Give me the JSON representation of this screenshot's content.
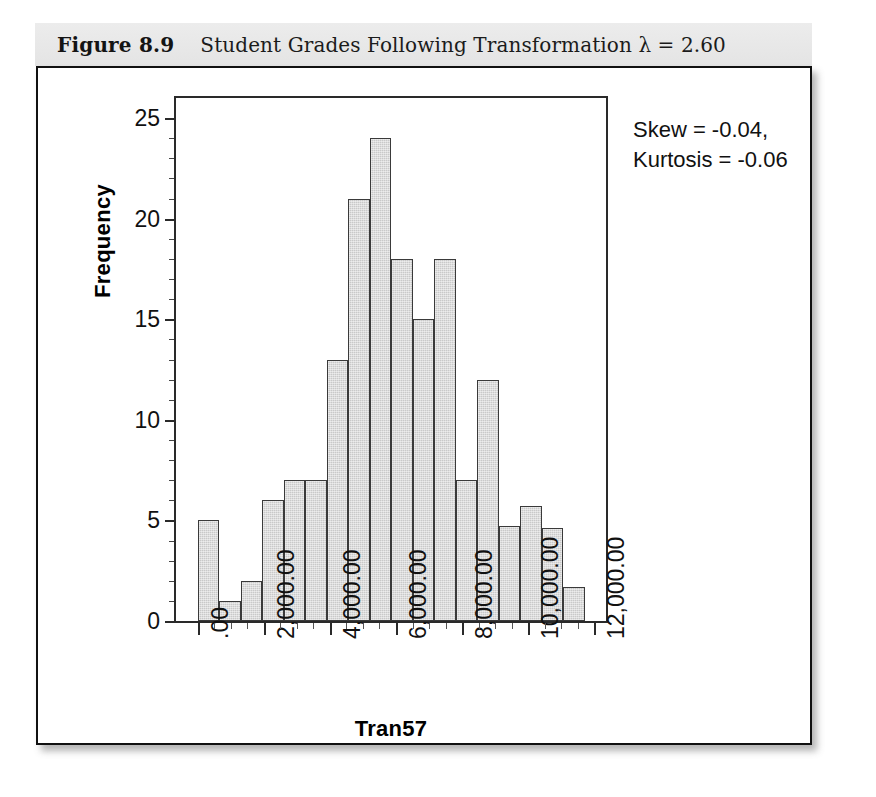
{
  "figure": {
    "number": "Figure 8.9",
    "caption": "Student Grades Following Transformation λ = 2.60"
  },
  "annotation": {
    "skew": "Skew = -0.04,",
    "kurtosis": "Kurtosis = -0.06"
  },
  "chart_data": {
    "type": "bar",
    "title": "Student Grades Following Transformation λ = 2.60",
    "xlabel": "Tran57",
    "ylabel": "Frequency",
    "xlim": [
      -650,
      12350
    ],
    "ylim": [
      0,
      26
    ],
    "grid": false,
    "legend": null,
    "bin_width": 650,
    "ytick_labels": [
      "0",
      "5",
      "10",
      "15",
      "20",
      "25"
    ],
    "ytick_values": [
      0,
      5,
      10,
      15,
      20,
      25
    ],
    "xtick_labels": [
      ".00",
      "2,000.00",
      "4,000.00",
      "6,000.00",
      "8,000.00",
      "10,000.00",
      "12,000.00"
    ],
    "xtick_values": [
      0,
      2000,
      4000,
      6000,
      8000,
      10000,
      12000
    ],
    "bin_starts": [
      0,
      650,
      1300,
      1950,
      2600,
      3250,
      3900,
      4550,
      5200,
      5850,
      6500,
      7150,
      7800,
      8450,
      9100,
      9750,
      10400,
      11050
    ],
    "values": [
      5,
      1,
      2,
      6,
      7,
      7,
      13,
      21,
      24,
      18,
      15,
      18,
      7,
      12,
      4.7,
      5.7,
      4.6,
      1.7
    ],
    "annotations": [
      "Skew = -0.04,",
      "Kurtosis = -0.06"
    ],
    "colors": {
      "bar_fill": "#c9c9c9",
      "bar_edge": "#3a3a3a",
      "axis": "#2a2a2a",
      "text": "#111111",
      "title_band": "#e8e8e8"
    }
  }
}
